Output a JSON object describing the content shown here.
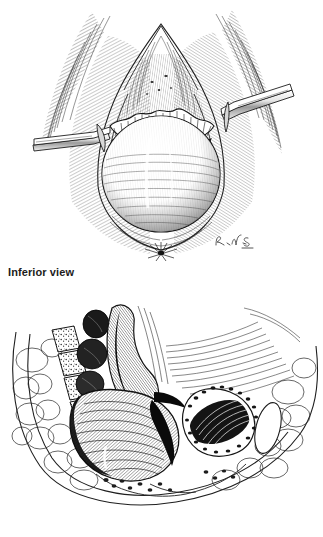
{
  "figure": {
    "background_color": "#ffffff",
    "ink_color": "#111111",
    "caption_color": "#1c1c1c",
    "medium": "pen-and-ink stipple and hatch medical illustration",
    "panels": [
      {
        "id": "inferior",
        "caption": "Inferior view",
        "subject": "perineal exposure held open by two flat retractor blades, with a rounded protruding mass at center",
        "elements": {
          "left_retractor_label": "retractor-blade-left",
          "right_retractor_label": "retractor-blade-right",
          "mass_label": "prolapsed-mass",
          "anus_label": "anal-verge"
        },
        "signature": "R.V.S."
      },
      {
        "id": "side",
        "caption": "Side view",
        "subject": "midsagittal section of the pelvis showing sacrum, rectum, bladder and surrounding adipose tissue",
        "elements": {
          "sacrum_label": "sacral-vertebrae",
          "rectum_label": "rectum",
          "bladder_label": "bladder-cavity",
          "fat_label": "adipose-tissue",
          "muscle_label": "pelvic-floor-muscle"
        }
      }
    ]
  }
}
